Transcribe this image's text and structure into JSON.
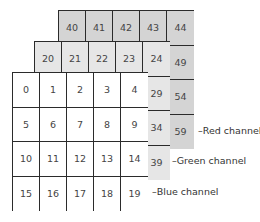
{
  "diagram": {
    "type": "rgb-channel-stack",
    "channels": [
      {
        "name": "red",
        "label": "–Red channel",
        "fill": "#d4d4d4",
        "rows": [
          [
            40,
            41,
            42,
            43,
            44
          ],
          [
            45,
            46,
            47,
            48,
            49
          ],
          [
            50,
            51,
            52,
            53,
            54
          ],
          [
            55,
            56,
            57,
            58,
            59
          ]
        ]
      },
      {
        "name": "green",
        "label": "–Green channel",
        "fill": "#e6e6e6",
        "rows": [
          [
            20,
            21,
            22,
            23,
            24
          ],
          [
            25,
            26,
            27,
            28,
            29
          ],
          [
            30,
            31,
            32,
            33,
            34
          ],
          [
            35,
            36,
            37,
            38,
            39
          ]
        ]
      },
      {
        "name": "blue",
        "label": "–Blue channel",
        "fill": "#ffffff",
        "rows": [
          [
            0,
            1,
            2,
            3,
            4
          ],
          [
            5,
            6,
            7,
            8,
            9
          ],
          [
            10,
            11,
            12,
            13,
            14
          ],
          [
            15,
            16,
            17,
            18,
            19
          ]
        ]
      }
    ],
    "border_color": "#2b2b2b"
  }
}
